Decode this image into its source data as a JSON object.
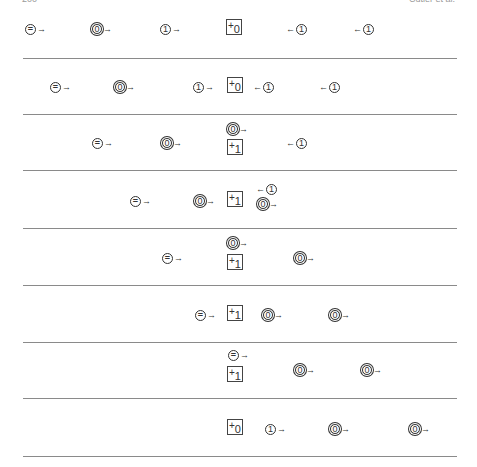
{
  "header": {
    "left": "200",
    "right": "Cutler et al."
  },
  "rules_y": [
    58,
    114,
    170,
    228,
    285,
    342,
    398,
    456
  ],
  "rows": [
    {
      "items": [
        {
          "kind": "eq",
          "dir": "right",
          "x": 25,
          "y": 22
        },
        {
          "kind": "zero",
          "dir": "right",
          "x": 92,
          "y": 22
        },
        {
          "kind": "one",
          "dir": "right",
          "x": 160,
          "y": 22
        },
        {
          "kind": "box",
          "sub": "0",
          "x": 226,
          "y": 19
        },
        {
          "kind": "one",
          "dir": "left",
          "x": 285,
          "y": 22
        },
        {
          "kind": "one",
          "dir": "left",
          "x": 352,
          "y": 22
        }
      ]
    },
    {
      "items": [
        {
          "kind": "eq",
          "dir": "right",
          "x": 50,
          "y": 80
        },
        {
          "kind": "zero",
          "dir": "right",
          "x": 115,
          "y": 80
        },
        {
          "kind": "one",
          "dir": "right",
          "x": 193,
          "y": 80
        },
        {
          "kind": "box",
          "sub": "0",
          "x": 227,
          "y": 77
        },
        {
          "kind": "one",
          "dir": "left",
          "x": 252,
          "y": 80
        },
        {
          "kind": "one",
          "dir": "left",
          "x": 318,
          "y": 80
        }
      ]
    },
    {
      "items": [
        {
          "kind": "eq",
          "dir": "right",
          "x": 92,
          "y": 136
        },
        {
          "kind": "zero",
          "dir": "right",
          "x": 162,
          "y": 136
        },
        {
          "kind": "zero",
          "dir": "right",
          "x": 228,
          "y": 122
        },
        {
          "kind": "box",
          "sub": "1",
          "x": 227,
          "y": 139
        },
        {
          "kind": "one",
          "dir": "left",
          "x": 285,
          "y": 136
        }
      ]
    },
    {
      "items": [
        {
          "kind": "eq",
          "dir": "right",
          "x": 130,
          "y": 194
        },
        {
          "kind": "zero",
          "dir": "right",
          "x": 195,
          "y": 194
        },
        {
          "kind": "box",
          "sub": "1",
          "x": 227,
          "y": 191
        },
        {
          "kind": "one",
          "dir": "left",
          "x": 255,
          "y": 182
        },
        {
          "kind": "zero",
          "dir": "right",
          "x": 258,
          "y": 197
        }
      ]
    },
    {
      "items": [
        {
          "kind": "eq",
          "dir": "right",
          "x": 162,
          "y": 251
        },
        {
          "kind": "zero",
          "dir": "right",
          "x": 228,
          "y": 236
        },
        {
          "kind": "box",
          "sub": "1",
          "x": 227,
          "y": 254
        },
        {
          "kind": "zero",
          "dir": "right",
          "x": 295,
          "y": 251
        }
      ]
    },
    {
      "items": [
        {
          "kind": "eq",
          "dir": "right",
          "x": 195,
          "y": 308
        },
        {
          "kind": "box",
          "sub": "1",
          "x": 227,
          "y": 305
        },
        {
          "kind": "zero",
          "dir": "right",
          "x": 263,
          "y": 308
        },
        {
          "kind": "zero",
          "dir": "right",
          "x": 330,
          "y": 308
        }
      ]
    },
    {
      "items": [
        {
          "kind": "eq",
          "dir": "right",
          "x": 228,
          "y": 348
        },
        {
          "kind": "box",
          "sub": "1",
          "x": 227,
          "y": 366
        },
        {
          "kind": "zero",
          "dir": "right",
          "x": 295,
          "y": 363
        },
        {
          "kind": "zero",
          "dir": "right",
          "x": 362,
          "y": 363
        }
      ]
    },
    {
      "items": [
        {
          "kind": "box",
          "sub": "0",
          "x": 227,
          "y": 419
        },
        {
          "kind": "one",
          "dir": "right",
          "x": 265,
          "y": 422
        },
        {
          "kind": "zero",
          "dir": "right",
          "x": 330,
          "y": 422
        },
        {
          "kind": "zero",
          "dir": "right",
          "x": 410,
          "y": 422
        }
      ]
    }
  ],
  "labels": {
    "eq": "=",
    "zero": "0",
    "one": "1",
    "plus": "+",
    "arrow_right": "→",
    "arrow_left": "←"
  }
}
